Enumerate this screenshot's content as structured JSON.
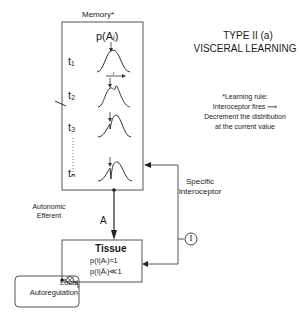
{
  "title": {
    "line1": "TYPE II (a)",
    "line2": "VISCERAL LEARNING"
  },
  "memory": {
    "label": "Memory*",
    "distribution_label": "p(Aᵢ)",
    "time_steps": [
      "t₁",
      "t₂",
      "t₃",
      "tₙ"
    ]
  },
  "learning_rule": {
    "heading": "*Learning rule:",
    "line1": "Interoceptor fires ⟹",
    "line2": "Decrement the distribution",
    "line3": "at the current value"
  },
  "connections": {
    "specific_interoceptor": "Specific\nInteroceptor",
    "specific_line1": "Specific",
    "specific_line2": "Interoceptor",
    "interoceptor_symbol": "I",
    "efferent_line1": "Autonomic",
    "efferent_line2": "Efferent",
    "efferent_signal": "A"
  },
  "tissue": {
    "label": "Tissue",
    "prob1": "p(I|Aᵢ)≈1",
    "prob2": "p(I|Āᵢ)≪1"
  },
  "local_autoregulation": {
    "line1": "Local",
    "line2": "Autoregulation",
    "symbol": "⊗"
  }
}
